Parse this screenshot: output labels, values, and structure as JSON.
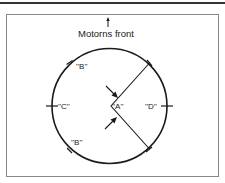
{
  "diagram": {
    "title": "Motorns front",
    "labels": {
      "a": "''A''",
      "b_top": "''B''",
      "b_bottom": "''B''",
      "c": "''C''",
      "d": "''D''"
    },
    "colors": {
      "line": "#1a1a1a",
      "border": "#888888",
      "topbar": "#333333"
    }
  }
}
